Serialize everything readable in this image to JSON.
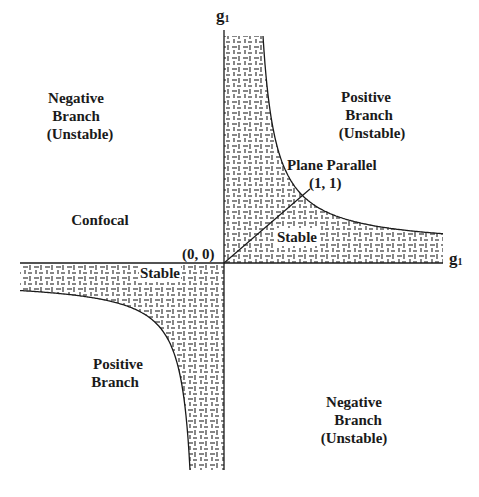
{
  "axes": {
    "vertical_label": "g",
    "vertical_subscript": "1",
    "horizontal_label": "g",
    "horizontal_subscript": "1"
  },
  "regions": {
    "top_left": [
      "Negative",
      "Branch",
      "(Unstable)"
    ],
    "top_right": [
      "Positive",
      "Branch",
      "(Unstable)"
    ],
    "left": [
      "Confocal"
    ],
    "bottom_left": [
      "Positive",
      "Branch"
    ],
    "bottom_right": [
      "Negative",
      "Branch",
      "(Unstable)"
    ],
    "stable_upper": "Stable",
    "stable_lower": "Stable"
  },
  "points": {
    "origin": "(0, 0)",
    "plane_parallel_label": "Plane Parallel",
    "plane_parallel_point": "(1, 1)"
  },
  "colors": {
    "line": "#1a1a1a",
    "hatch": "#222222",
    "background": "#ffffff"
  },
  "stability_condition": "0 <= g1*g2 <= 1"
}
